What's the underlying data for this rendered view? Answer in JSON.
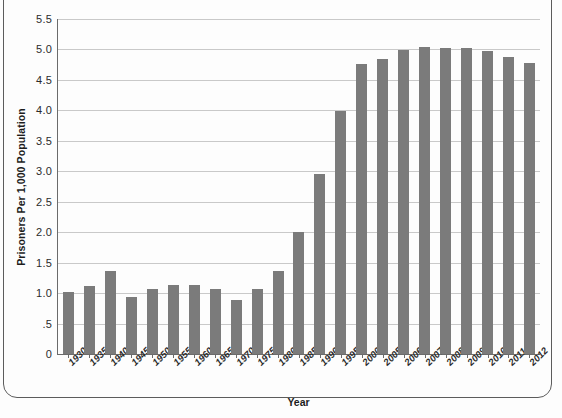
{
  "chart_data": {
    "type": "bar",
    "title": "",
    "xlabel": "Year",
    "ylabel": "Prisoners Per 1,000 Population",
    "categories": [
      "1930",
      "1935",
      "1940",
      "1945",
      "1950",
      "1955",
      "1960",
      "1965",
      "1970",
      "1975",
      "1980",
      "1985",
      "1990",
      "1995",
      "2000",
      "2005",
      "2006",
      "2007",
      "2008",
      "2009",
      "2010",
      "2011",
      "2012"
    ],
    "values": [
      1.01,
      1.11,
      1.36,
      0.93,
      1.06,
      1.13,
      1.13,
      1.06,
      0.89,
      1.07,
      1.36,
      2.0,
      2.95,
      3.99,
      4.76,
      4.84,
      4.99,
      5.04,
      5.02,
      5.02,
      4.97,
      4.88,
      4.78
    ],
    "ylim": [
      0,
      5.5
    ],
    "yticks": [
      0,
      0.5,
      1.0,
      1.5,
      2.0,
      2.5,
      3.0,
      3.5,
      4.0,
      4.5,
      5.0,
      5.5
    ],
    "ytick_labels": [
      "0",
      ".5",
      "1.0",
      "1.5",
      "2.0",
      "2.5",
      "3.0",
      "3.5",
      "4.0",
      "4.5",
      "5.0",
      "5.5"
    ],
    "grid": true,
    "legend": false,
    "bar_color": "#7b7b7b",
    "gridline_color": "#c9c9c9",
    "axis_color": "#6b6b6b"
  },
  "frame": {
    "border_color": "#5c5c5c",
    "background": "#fdfdfd"
  }
}
